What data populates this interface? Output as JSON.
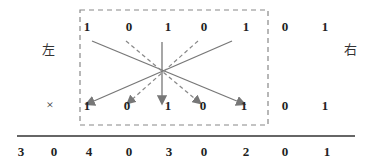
{
  "labels": {
    "left": "左",
    "right": "右",
    "multiply": "×"
  },
  "top_row": [
    "1",
    "0",
    "1",
    "0",
    "1",
    "0",
    "1"
  ],
  "bottom_row": [
    "1",
    "0",
    "1",
    "0",
    "1",
    "0",
    "1"
  ],
  "result_row": [
    "3",
    "0",
    "4",
    "0",
    "3",
    "0",
    "2",
    "0",
    "1"
  ],
  "colors": {
    "line": "#777777",
    "text": "#222222"
  }
}
